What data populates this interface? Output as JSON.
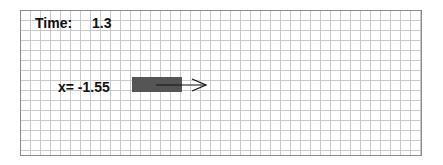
{
  "time": {
    "label": "Time:",
    "value": "1.3"
  },
  "position": {
    "label": "x= -1.55"
  },
  "colors": {
    "block": "#555555",
    "grid": "#c9c9c9",
    "border": "#8a8a8a",
    "arrow": "#111111"
  },
  "icons": {
    "velocity_arrow": "arrow-right-icon"
  }
}
